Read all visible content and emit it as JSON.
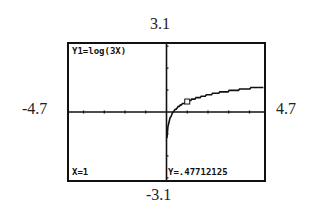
{
  "window": {
    "ymax_label": "3.1",
    "ymin_label": "-3.1",
    "xmin_label": "-4.7",
    "xmax_label": "4.7"
  },
  "screen": {
    "equation": "Y1=log(3X)",
    "trace_x": "X=1",
    "trace_y": "Y=.47712125"
  },
  "chart_data": {
    "type": "line",
    "title": "Y1=log(3X)",
    "function": "log(3x)",
    "xlim": [
      -4.7,
      4.7
    ],
    "ylim": [
      -3.1,
      3.1
    ],
    "xlabel": "",
    "ylabel": "",
    "grid": false,
    "x_tick_step": 1,
    "y_tick_step": 1,
    "trace_point": {
      "x": 1,
      "y": 0.47712125
    },
    "series": [
      {
        "name": "Y1",
        "x": [
          0.1,
          0.2,
          0.333,
          0.5,
          1,
          1.5,
          2,
          2.5,
          3,
          3.5,
          4,
          4.5,
          4.7
        ],
        "values": [
          -0.523,
          -0.222,
          0.0,
          0.176,
          0.477,
          0.653,
          0.778,
          0.875,
          0.954,
          1.021,
          1.079,
          1.13,
          1.149
        ]
      }
    ]
  }
}
